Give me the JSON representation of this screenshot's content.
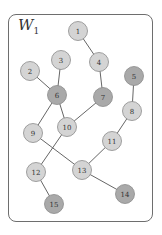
{
  "graph": {
    "title_main": "W",
    "title_sub": "1",
    "colors": {
      "light_fill": "#d4d4d4",
      "dark_fill": "#a9a9a9",
      "node_stroke": "#8a8a8a",
      "edge": "#666666",
      "frame": "#6e6e6e"
    },
    "nodes": [
      {
        "id": "1",
        "x": 78,
        "y": 31,
        "shade": "light"
      },
      {
        "id": "2",
        "x": 30,
        "y": 71,
        "shade": "light"
      },
      {
        "id": "3",
        "x": 61,
        "y": 60,
        "shade": "light"
      },
      {
        "id": "4",
        "x": 99,
        "y": 62,
        "shade": "light"
      },
      {
        "id": "5",
        "x": 134,
        "y": 76,
        "shade": "dark"
      },
      {
        "id": "6",
        "x": 57,
        "y": 95,
        "shade": "dark"
      },
      {
        "id": "7",
        "x": 103,
        "y": 97,
        "shade": "dark"
      },
      {
        "id": "8",
        "x": 132,
        "y": 111,
        "shade": "light"
      },
      {
        "id": "9",
        "x": 33,
        "y": 133,
        "shade": "light"
      },
      {
        "id": "10",
        "x": 67,
        "y": 127,
        "shade": "light"
      },
      {
        "id": "11",
        "x": 112,
        "y": 141,
        "shade": "light"
      },
      {
        "id": "12",
        "x": 36,
        "y": 172,
        "shade": "light"
      },
      {
        "id": "13",
        "x": 82,
        "y": 170,
        "shade": "light"
      },
      {
        "id": "14",
        "x": 125,
        "y": 194,
        "shade": "dark"
      },
      {
        "id": "15",
        "x": 54,
        "y": 204,
        "shade": "dark"
      }
    ],
    "edges": [
      [
        "1",
        "4"
      ],
      [
        "4",
        "7"
      ],
      [
        "2",
        "6"
      ],
      [
        "3",
        "6"
      ],
      [
        "6",
        "9"
      ],
      [
        "6",
        "10"
      ],
      [
        "7",
        "10"
      ],
      [
        "5",
        "8"
      ],
      [
        "8",
        "11"
      ],
      [
        "11",
        "13"
      ],
      [
        "9",
        "13"
      ],
      [
        "10",
        "12"
      ],
      [
        "12",
        "15"
      ],
      [
        "13",
        "14"
      ]
    ]
  }
}
